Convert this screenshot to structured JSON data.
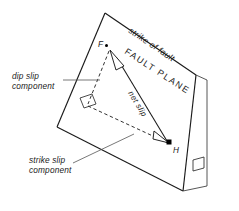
{
  "diagram": {
    "labels": {
      "strike_of_fault": "strike of fault",
      "fault_plane": "FAULT PLANE",
      "dip_slip_line1": "dip slip",
      "dip_slip_line2": "component",
      "strike_slip_line1": "strike slip",
      "strike_slip_line2": "component",
      "net_slip": "net slip",
      "point_f": "F",
      "point_h": "H"
    },
    "colors": {
      "outline": "#1a1a1a",
      "dashed": "#262626",
      "leader": "#555555",
      "background": "#ffffff",
      "point": "#000000"
    },
    "geometry": {
      "apex": "105,13",
      "top_right": "196,75",
      "bottom_left": "57,127",
      "bottom_vertex": "183,191",
      "point_f": "110,48",
      "point_h": "170,143",
      "right_angle_corner": "88,105"
    }
  }
}
